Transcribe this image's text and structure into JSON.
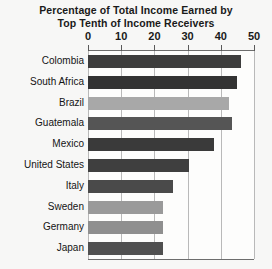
{
  "chart_data": {
    "type": "bar",
    "orientation": "horizontal",
    "title": "Percentage of Total Income Earned by Top Tenth of Income Receivers",
    "title_lines": [
      "Percentage of Total Income Earned by",
      "Top Tenth of Income Receivers"
    ],
    "xlabel": "",
    "ylabel": "",
    "xlim": [
      0,
      50
    ],
    "xticks": [
      0,
      10,
      20,
      30,
      40,
      50
    ],
    "xtick_labels": [
      "0",
      "10",
      "20",
      "30",
      "40",
      "50"
    ],
    "grid": true,
    "grid_axis": "x",
    "legend": false,
    "categories": [
      "Colombia",
      "South Africa",
      "Brazil",
      "Guatemala",
      "Mexico",
      "United States",
      "Italy",
      "Sweden",
      "Germany",
      "Japan"
    ],
    "values": [
      46,
      45,
      42.5,
      43.5,
      38,
      30.5,
      25.5,
      22.5,
      22.5,
      22.5
    ],
    "bar_colors": [
      "#3d3d3d",
      "#333333",
      "#a8a8a8",
      "#555555",
      "#3a3a3a",
      "#3f3f3f",
      "#4a4a4a",
      "#9a9a9a",
      "#8f8f8f",
      "#505050"
    ],
    "series": [
      {
        "name": "Percentage of total income",
        "values": [
          46,
          45,
          42.5,
          43.5,
          38,
          30.5,
          25.5,
          22.5,
          22.5,
          22.5
        ]
      }
    ]
  },
  "colors": {
    "background": "#f7f7f6",
    "plot_background": "#fdfdfc",
    "axis": "#6d6d6d",
    "gridline": "#b9b9b9",
    "text": "#141414"
  }
}
